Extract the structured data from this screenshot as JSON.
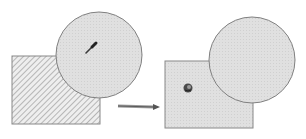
{
  "diagram": {
    "colors": {
      "background": "#ffffff",
      "outline": "#808080",
      "fill_gray": "#dcdcdc",
      "hatch": "#a8a8a8",
      "icon": "#3a3a3a",
      "arrow": "#707070"
    },
    "before": {
      "square": {
        "x": 12,
        "y": 56,
        "w": 88,
        "h": 68,
        "fill": "hatched"
      },
      "circle": {
        "cx": 99,
        "cy": 55,
        "r": 43,
        "fill": "gray"
      },
      "icon": "eyedropper-icon"
    },
    "arrow": {
      "x1": 118,
      "y1": 106,
      "x2": 158,
      "y2": 107
    },
    "after": {
      "square": {
        "x": 165,
        "y": 61,
        "w": 88,
        "h": 67,
        "fill": "gray"
      },
      "circle": {
        "cx": 252,
        "cy": 60,
        "r": 43,
        "fill": "gray"
      },
      "icon": "paint-bucket-icon"
    }
  }
}
